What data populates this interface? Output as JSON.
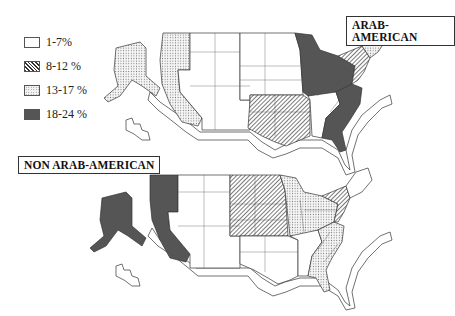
{
  "legend": {
    "items": [
      {
        "label": "1-7%",
        "pattern": "white"
      },
      {
        "label": "8-12 %",
        "pattern": "hatch"
      },
      {
        "label": "13-17 %",
        "pattern": "dots"
      },
      {
        "label": "18-24 %",
        "pattern": "dark"
      }
    ]
  },
  "maps": [
    {
      "title": "ARAB-AMERICAN",
      "regions": {
        "pacific_west": "dots",
        "alaska": "dots",
        "mountain": "white",
        "plains_north": "white",
        "south_central": "hatch",
        "great_lakes": "dark",
        "southeast": "dark",
        "tennessee_alabama_mississippi": "white",
        "new_york_pennsylvania": "hatch",
        "new_england": "dots"
      }
    },
    {
      "title": "NON ARAB-AMERICAN",
      "regions": {
        "pacific_west": "dark",
        "alaska": "dark",
        "mountain": "white",
        "plains_north": "hatch",
        "south_central": "white",
        "great_lakes": "dots",
        "southeast": "dots",
        "tennessee_alabama_mississippi": "white",
        "new_york_pennsylvania": "hatch",
        "new_england": "white"
      }
    }
  ],
  "colors": {
    "dark": "#555555",
    "outline": "#222222",
    "hatch_line": "#333333",
    "dots": "#777777"
  }
}
